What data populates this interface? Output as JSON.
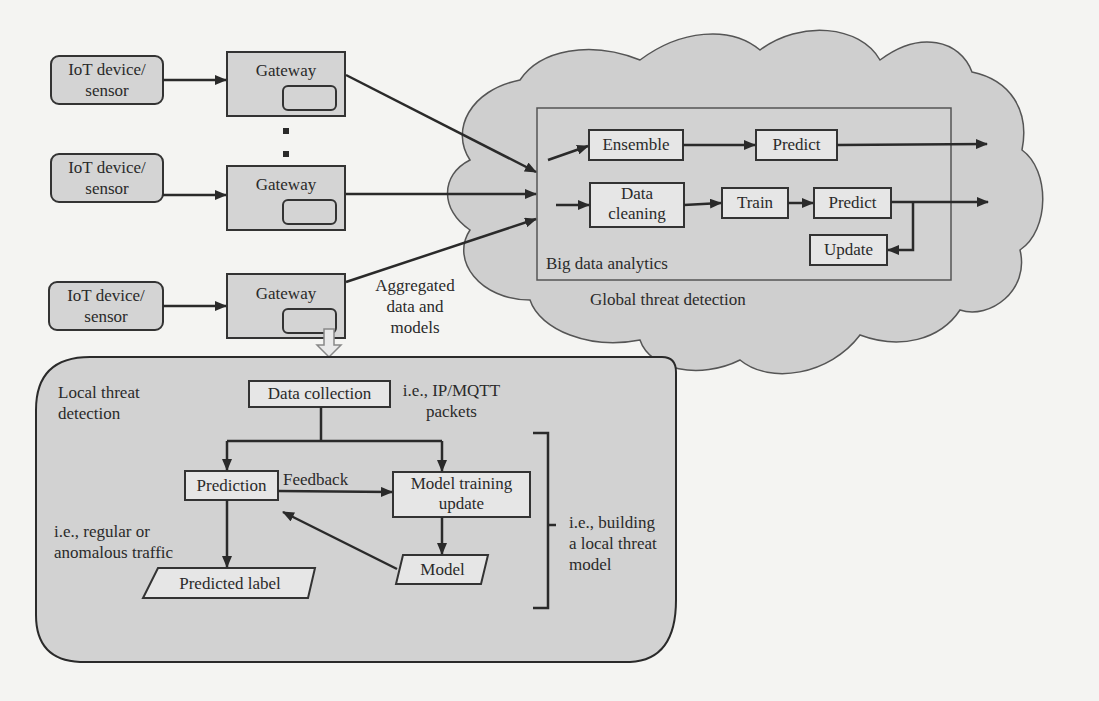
{
  "colors": {
    "background": "#f4f4f2",
    "cloud_fill": "#cfcfcf",
    "box_fill": "#e6e6e6",
    "inner_box_fill": "#d9d9d9",
    "stroke": "#333333",
    "hollow_arrow": "#e9e9e9"
  },
  "devices": [
    {
      "label_line1": "IoT device/",
      "label_line2": "sensor"
    },
    {
      "label_line1": "IoT device/",
      "label_line2": "sensor"
    },
    {
      "label_line1": "IoT device/",
      "label_line2": "sensor"
    }
  ],
  "gateways": [
    {
      "label": "Gateway"
    },
    {
      "label": "Gateway"
    },
    {
      "label": "Gateway"
    }
  ],
  "ellipsis": "⋮",
  "aggregated_label": {
    "line1": "Aggregated",
    "line2": "data and",
    "line3": "models"
  },
  "global": {
    "cloud_label": "Global threat detection",
    "big_data_label": "Big data analytics",
    "pipeline_top": {
      "ensemble": "Ensemble",
      "predict": "Predict"
    },
    "pipeline_bottom": {
      "data_cleaning_line1": "Data",
      "data_cleaning_line2": "cleaning",
      "train": "Train",
      "predict": "Predict",
      "update": "Update"
    }
  },
  "local": {
    "title_line1": "Local threat",
    "title_line2": "detection",
    "data_collection": "Data collection",
    "data_collection_note_line1": "i.e., IP/MQTT",
    "data_collection_note_line2": "packets",
    "prediction": "Prediction",
    "feedback": "Feedback",
    "model_training_line1": "Model training",
    "model_training_line2": "update",
    "model": "Model",
    "predicted_label": "Predicted label",
    "prediction_note_line1": "i.e., regular or",
    "prediction_note_line2": "anomalous traffic",
    "bracket_note_line1": "i.e., building",
    "bracket_note_line2": "a local threat",
    "bracket_note_line3": "model"
  }
}
